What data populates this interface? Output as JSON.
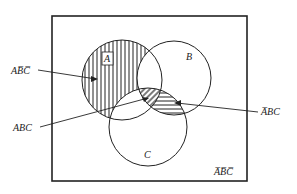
{
  "diagram": {
    "type": "venn",
    "sets": [
      {
        "name": "A",
        "label": "A"
      },
      {
        "name": "B",
        "label": "B"
      },
      {
        "name": "C",
        "label": "C"
      }
    ],
    "regions": [
      {
        "id": "a_notb_notc",
        "label": "AB̅C̅",
        "hatch": "vertical"
      },
      {
        "id": "abc",
        "label": "ABC",
        "hatch": "diagonal"
      },
      {
        "id": "nota_bc",
        "label": "A̅BC",
        "hatch": "horizontal"
      },
      {
        "id": "nota_notb_notc",
        "label": "A̅B̅C̅",
        "hatch": "none"
      }
    ],
    "colors": {
      "line": "#222222",
      "background": "#ffffff"
    }
  }
}
